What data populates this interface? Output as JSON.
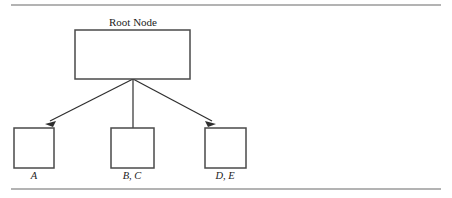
{
  "figure": {
    "type": "tree-diagram",
    "caption_rules": {
      "top_rule_y": 5,
      "bottom_rule_y": 189,
      "rule_x_start": 11,
      "rule_x_end": 441,
      "color": "#9a9a9a"
    },
    "colors": {
      "background": "#ffffff",
      "box_stroke": "#4a4a4a",
      "edge_stroke": "#2e2e2e",
      "text": "#1c1c1c",
      "rule": "#9a9a9a"
    },
    "root": {
      "label": "Root Node",
      "label_style": "upright-serif",
      "box": {
        "x": 75,
        "y": 30,
        "width": 115,
        "height": 49
      },
      "label_position": "above",
      "label_x": 133,
      "label_y": 26
    },
    "fan_origin": {
      "x": 133,
      "y": 79
    },
    "children": [
      {
        "label": "A",
        "label_style": "italic-serif",
        "box": {
          "x": 14,
          "y": 128,
          "width": 40,
          "height": 40
        },
        "label_x": 34,
        "label_y": 179,
        "edge_end": {
          "x": 51,
          "y": 126
        },
        "arrow": true
      },
      {
        "label": "B, C",
        "label_style": "italic-serif",
        "box": {
          "x": 111,
          "y": 128,
          "width": 43,
          "height": 40
        },
        "label_x": 132,
        "label_y": 179,
        "edge_end": {
          "x": 133,
          "y": 126
        },
        "arrow": true
      },
      {
        "label": "D, E",
        "label_style": "italic-serif",
        "box": {
          "x": 205,
          "y": 128,
          "width": 41,
          "height": 40
        },
        "label_x": 225,
        "label_y": 179,
        "edge_end": {
          "x": 210,
          "y": 126
        },
        "arrow": true
      }
    ]
  }
}
